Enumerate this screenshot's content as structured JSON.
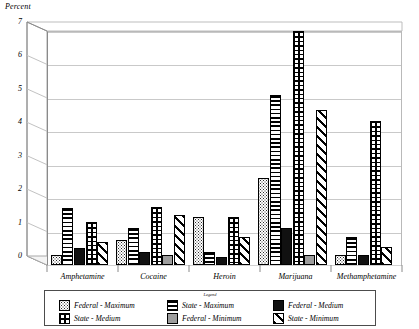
{
  "chart_data": {
    "type": "bar",
    "title": "",
    "ylabel": "Percent",
    "xlabel": "",
    "ylim": [
      0,
      7
    ],
    "yticks": [
      "0",
      "1",
      "2",
      "3",
      "4",
      "5",
      "6",
      "7"
    ],
    "grid": true,
    "legend_position": "bottom",
    "legend_title": "Legend",
    "categories": [
      "Amphetamine",
      "Cocaine",
      "Heroin",
      "Marijuana",
      "Methamphetamine"
    ],
    "series": [
      {
        "name": "Federal - Maximum",
        "pattern": "dotted",
        "values": [
          0.3,
          0.75,
          1.45,
          2.6,
          0.3
        ]
      },
      {
        "name": "State - Maximum",
        "pattern": "horizontal",
        "values": [
          1.7,
          1.1,
          0.4,
          5.1,
          0.85
        ]
      },
      {
        "name": "Federal - Medium",
        "pattern": "solid-black",
        "values": [
          0.5,
          0.4,
          0.25,
          1.1,
          0.3
        ]
      },
      {
        "name": "State - Medium",
        "pattern": "cross-hatch",
        "values": [
          1.3,
          1.75,
          1.45,
          7.0,
          4.3
        ]
      },
      {
        "name": "Federal - Minimum",
        "pattern": "solid-gray",
        "values": [
          0,
          0.3,
          0,
          0.3,
          0
        ]
      },
      {
        "name": "State - Minimum",
        "pattern": "diagonal",
        "values": [
          0.7,
          1.5,
          0.85,
          4.65,
          0.55
        ]
      }
    ]
  },
  "axis": {
    "y_title": "Percent",
    "ticks": [
      "7",
      "6",
      "5",
      "4",
      "3",
      "2",
      "1",
      "0"
    ],
    "category_labels": [
      "Amphetamine",
      "Cocaine",
      "Heroin",
      "Marijuana",
      "Methamphetamine"
    ]
  },
  "legend": {
    "title": "Legend",
    "entries": [
      {
        "label": "Federal - Maximum"
      },
      {
        "label": "State - Maximum"
      },
      {
        "label": "Federal - Medium"
      },
      {
        "label": "State - Medium"
      },
      {
        "label": "Federal - Minimum"
      },
      {
        "label": "State - Minimum"
      }
    ]
  },
  "colors": {
    "axis": "#8a8a8a",
    "grid": "#c9c9c9",
    "bar_outline": "#000000",
    "federal_medium": "#111111",
    "federal_minimum": "#9d9d9d"
  }
}
